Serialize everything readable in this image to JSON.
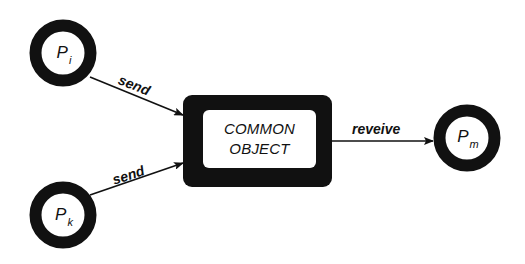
{
  "diagram": {
    "type": "message-passing",
    "nodes": [
      {
        "id": "pi",
        "label": "P",
        "subscript": "i",
        "shape": "ring",
        "center": [
          63,
          53
        ]
      },
      {
        "id": "pk",
        "label": "P",
        "subscript": "k",
        "shape": "ring",
        "center": [
          63,
          216
        ]
      },
      {
        "id": "pm",
        "label": "P",
        "subscript": "m",
        "shape": "ring",
        "center": [
          467,
          138
        ]
      },
      {
        "id": "common",
        "label_line1": "COMMON",
        "label_line2": "OBJECT",
        "shape": "thick-rounded-box"
      }
    ],
    "edges": [
      {
        "from": "pi",
        "to": "common",
        "label": "send"
      },
      {
        "from": "pk",
        "to": "common",
        "label": "send"
      },
      {
        "from": "common",
        "to": "pm",
        "label": "reveive"
      }
    ],
    "colors": {
      "stroke": "#111111",
      "background": "#ffffff"
    }
  }
}
